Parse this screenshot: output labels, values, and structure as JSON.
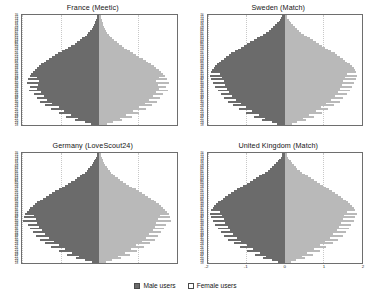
{
  "figure": {
    "background_color": "#ffffff",
    "male_color": "#6b6b6b",
    "female_color": "#b9b9b9"
  },
  "legend": {
    "position": "bottom-center",
    "items": [
      {
        "label": "Male users",
        "key": "male",
        "color": "#6b6b6b"
      },
      {
        "label": "Female users",
        "key": "female",
        "color": "#ffffff"
      }
    ]
  },
  "chart_data": [
    {
      "type": "bar",
      "subtype": "population-pyramid",
      "title": "France (Meetic)",
      "xlabel": "",
      "ylabel": "",
      "xlim": [
        -2,
        2
      ],
      "ylim": [
        18,
        76
      ],
      "grid": false,
      "xticks": [
        -2,
        -1,
        0,
        1,
        2
      ],
      "xtick_labels": [
        "-2",
        "-1",
        "0",
        "1",
        "2"
      ],
      "show_xticklabels": false,
      "categories": [
        76,
        75,
        74,
        73,
        72,
        71,
        70,
        69,
        68,
        67,
        66,
        65,
        64,
        63,
        62,
        61,
        60,
        59,
        58,
        57,
        56,
        55,
        54,
        53,
        52,
        51,
        50,
        49,
        48,
        47,
        46,
        45,
        44,
        43,
        42,
        41,
        40,
        39,
        38,
        37,
        36,
        35,
        34,
        33,
        32,
        31,
        30,
        29,
        28,
        27,
        26,
        25,
        24,
        23,
        22,
        21,
        20,
        19,
        18
      ],
      "series": [
        {
          "name": "Male users",
          "values": [
            -0.05,
            -0.07,
            -0.08,
            -0.1,
            -0.12,
            -0.14,
            -0.17,
            -0.2,
            -0.24,
            -0.28,
            -0.33,
            -0.38,
            -0.44,
            -0.5,
            -0.57,
            -0.64,
            -0.72,
            -0.8,
            -0.88,
            -0.97,
            -1.06,
            -1.14,
            -1.22,
            -1.3,
            -1.38,
            -1.44,
            -1.5,
            -1.56,
            -1.62,
            -1.67,
            -1.72,
            -1.76,
            -1.8,
            -1.62,
            -1.84,
            -1.55,
            -1.88,
            -1.58,
            -1.78,
            -1.6,
            -1.82,
            -1.52,
            -1.7,
            -1.44,
            -1.62,
            -1.34,
            -1.54,
            -1.22,
            -1.4,
            -1.05,
            -1.25,
            -0.9,
            -1.05,
            -0.72,
            -0.86,
            -0.55,
            -0.62,
            -0.38,
            -0.22
          ]
        },
        {
          "name": "Female users",
          "values": [
            0.04,
            0.05,
            0.06,
            0.08,
            0.09,
            0.11,
            0.13,
            0.15,
            0.18,
            0.21,
            0.25,
            0.29,
            0.34,
            0.39,
            0.45,
            0.51,
            0.58,
            0.65,
            0.72,
            0.8,
            0.88,
            0.96,
            1.04,
            1.12,
            1.2,
            1.27,
            1.34,
            1.41,
            1.48,
            1.54,
            1.6,
            1.66,
            1.71,
            1.54,
            1.76,
            1.48,
            1.8,
            1.52,
            1.72,
            1.55,
            1.78,
            1.48,
            1.66,
            1.4,
            1.58,
            1.3,
            1.5,
            1.18,
            1.36,
            1.02,
            1.22,
            0.88,
            1.02,
            0.7,
            0.84,
            0.54,
            0.6,
            0.36,
            0.2
          ]
        }
      ]
    },
    {
      "type": "bar",
      "subtype": "population-pyramid",
      "title": "Sweden (Match)",
      "xlabel": "",
      "ylabel": "",
      "xlim": [
        -2,
        2
      ],
      "ylim": [
        18,
        76
      ],
      "grid": false,
      "xticks": [
        -2,
        -1,
        0,
        1,
        2
      ],
      "xtick_labels": [
        "-2",
        "-1",
        "0",
        "1",
        "2"
      ],
      "show_xticklabels": false,
      "categories": [
        76,
        75,
        74,
        73,
        72,
        71,
        70,
        69,
        68,
        67,
        66,
        65,
        64,
        63,
        62,
        61,
        60,
        59,
        58,
        57,
        56,
        55,
        54,
        53,
        52,
        51,
        50,
        49,
        48,
        47,
        46,
        45,
        44,
        43,
        42,
        41,
        40,
        39,
        38,
        37,
        36,
        35,
        34,
        33,
        32,
        31,
        30,
        29,
        28,
        27,
        26,
        25,
        24,
        23,
        22,
        21,
        20,
        19,
        18
      ],
      "series": [
        {
          "name": "Male users",
          "values": [
            -0.06,
            -0.09,
            -0.12,
            -0.16,
            -0.2,
            -0.25,
            -0.3,
            -0.36,
            -0.42,
            -0.49,
            -0.56,
            -0.64,
            -0.72,
            -0.8,
            -0.89,
            -0.98,
            -1.06,
            -1.14,
            -1.22,
            -1.3,
            -1.38,
            -1.45,
            -1.52,
            -1.58,
            -1.64,
            -1.7,
            -1.75,
            -1.8,
            -1.84,
            -1.88,
            -1.91,
            -1.68,
            -1.94,
            -1.62,
            -1.9,
            -1.58,
            -1.86,
            -1.55,
            -1.8,
            -1.5,
            -1.74,
            -1.44,
            -1.66,
            -1.36,
            -1.58,
            -1.26,
            -1.48,
            -1.14,
            -1.34,
            -1.0,
            -1.18,
            -0.84,
            -1.0,
            -0.66,
            -0.8,
            -0.5,
            -0.58,
            -0.34,
            -0.2
          ]
        },
        {
          "name": "Female users",
          "values": [
            0.05,
            0.07,
            0.1,
            0.13,
            0.17,
            0.21,
            0.26,
            0.31,
            0.37,
            0.43,
            0.5,
            0.57,
            0.65,
            0.73,
            0.81,
            0.89,
            0.97,
            1.05,
            1.13,
            1.21,
            1.29,
            1.36,
            1.43,
            1.5,
            1.56,
            1.62,
            1.68,
            1.73,
            1.78,
            1.82,
            1.85,
            1.62,
            1.88,
            1.56,
            1.84,
            1.52,
            1.8,
            1.48,
            1.74,
            1.44,
            1.68,
            1.38,
            1.6,
            1.3,
            1.52,
            1.2,
            1.42,
            1.08,
            1.28,
            0.94,
            1.12,
            0.8,
            0.96,
            0.62,
            0.76,
            0.46,
            0.54,
            0.32,
            0.18
          ]
        }
      ]
    },
    {
      "type": "bar",
      "subtype": "population-pyramid",
      "title": "Germany (LoveScout24)",
      "xlabel": "",
      "ylabel": "",
      "xlim": [
        -2,
        2
      ],
      "ylim": [
        18,
        76
      ],
      "grid": false,
      "xticks": [
        -2,
        -1,
        0,
        1,
        2
      ],
      "xtick_labels": [
        "-2",
        "-1",
        "0",
        "1",
        "2"
      ],
      "show_xticklabels": false,
      "categories": [
        76,
        75,
        74,
        73,
        72,
        71,
        70,
        69,
        68,
        67,
        66,
        65,
        64,
        63,
        62,
        61,
        60,
        59,
        58,
        57,
        56,
        55,
        54,
        53,
        52,
        51,
        50,
        49,
        48,
        47,
        46,
        45,
        44,
        43,
        42,
        41,
        40,
        39,
        38,
        37,
        36,
        35,
        34,
        33,
        32,
        31,
        30,
        29,
        28,
        27,
        26,
        25,
        24,
        23,
        22,
        21,
        20,
        19,
        18
      ],
      "series": [
        {
          "name": "Male users",
          "values": [
            -0.05,
            -0.07,
            -0.09,
            -0.11,
            -0.14,
            -0.17,
            -0.2,
            -0.24,
            -0.28,
            -0.33,
            -0.38,
            -0.44,
            -0.5,
            -0.57,
            -0.64,
            -0.72,
            -0.8,
            -0.88,
            -0.96,
            -1.05,
            -1.14,
            -1.22,
            -1.3,
            -1.38,
            -1.46,
            -1.53,
            -1.6,
            -1.66,
            -1.72,
            -1.78,
            -1.83,
            -1.88,
            -1.92,
            -1.7,
            -1.96,
            -1.64,
            -1.98,
            -1.6,
            -1.84,
            -1.56,
            -1.8,
            -1.48,
            -1.72,
            -1.4,
            -1.64,
            -1.3,
            -1.54,
            -1.18,
            -1.4,
            -1.04,
            -1.24,
            -0.88,
            -1.04,
            -0.7,
            -0.84,
            -0.52,
            -0.6,
            -0.36,
            -0.2
          ]
        },
        {
          "name": "Female users",
          "values": [
            0.04,
            0.05,
            0.07,
            0.09,
            0.11,
            0.13,
            0.16,
            0.19,
            0.23,
            0.27,
            0.31,
            0.36,
            0.42,
            0.48,
            0.55,
            0.62,
            0.7,
            0.78,
            0.86,
            0.94,
            1.02,
            1.1,
            1.18,
            1.26,
            1.34,
            1.41,
            1.48,
            1.54,
            1.6,
            1.66,
            1.71,
            1.76,
            1.8,
            1.58,
            1.84,
            1.52,
            1.86,
            1.48,
            1.72,
            1.44,
            1.68,
            1.38,
            1.6,
            1.3,
            1.52,
            1.22,
            1.44,
            1.1,
            1.32,
            0.96,
            1.16,
            0.82,
            0.98,
            0.66,
            0.8,
            0.48,
            0.56,
            0.34,
            0.18
          ]
        }
      ]
    },
    {
      "type": "bar",
      "subtype": "population-pyramid",
      "title": "United Kingdom (Match)",
      "xlabel": "",
      "ylabel": "",
      "xlim": [
        -2,
        2
      ],
      "ylim": [
        18,
        76
      ],
      "grid": false,
      "xticks": [
        -2,
        -1,
        0,
        1,
        2
      ],
      "xtick_labels": [
        "-2",
        "-1",
        "0",
        "1",
        "2"
      ],
      "show_xticklabels": true,
      "categories": [
        76,
        75,
        74,
        73,
        72,
        71,
        70,
        69,
        68,
        67,
        66,
        65,
        64,
        63,
        62,
        61,
        60,
        59,
        58,
        57,
        56,
        55,
        54,
        53,
        52,
        51,
        50,
        49,
        48,
        47,
        46,
        45,
        44,
        43,
        42,
        41,
        40,
        39,
        38,
        37,
        36,
        35,
        34,
        33,
        32,
        31,
        30,
        29,
        28,
        27,
        26,
        25,
        24,
        23,
        22,
        21,
        20,
        19,
        18
      ],
      "series": [
        {
          "name": "Male users",
          "values": [
            -0.06,
            -0.08,
            -0.11,
            -0.14,
            -0.18,
            -0.22,
            -0.27,
            -0.32,
            -0.38,
            -0.44,
            -0.51,
            -0.58,
            -0.66,
            -0.74,
            -0.82,
            -0.9,
            -0.99,
            -1.08,
            -1.16,
            -1.24,
            -1.32,
            -1.4,
            -1.47,
            -1.54,
            -1.6,
            -1.66,
            -1.72,
            -1.77,
            -1.82,
            -1.86,
            -1.9,
            -1.68,
            -1.93,
            -1.62,
            -1.9,
            -1.58,
            -1.86,
            -1.54,
            -1.8,
            -1.48,
            -1.74,
            -1.42,
            -1.66,
            -1.34,
            -1.58,
            -1.24,
            -1.46,
            -1.12,
            -1.32,
            -0.98,
            -1.16,
            -0.82,
            -0.98,
            -0.64,
            -0.78,
            -0.48,
            -0.56,
            -0.32,
            -0.18
          ]
        },
        {
          "name": "Female users",
          "values": [
            0.05,
            0.07,
            0.09,
            0.12,
            0.15,
            0.19,
            0.23,
            0.28,
            0.33,
            0.39,
            0.45,
            0.52,
            0.59,
            0.67,
            0.75,
            0.83,
            0.91,
            0.99,
            1.07,
            1.15,
            1.23,
            1.31,
            1.38,
            1.45,
            1.52,
            1.58,
            1.64,
            1.7,
            1.75,
            1.79,
            1.83,
            1.6,
            1.86,
            1.54,
            1.82,
            1.5,
            1.78,
            1.46,
            1.72,
            1.4,
            1.66,
            1.34,
            1.58,
            1.26,
            1.5,
            1.16,
            1.38,
            1.04,
            1.24,
            0.9,
            1.08,
            0.76,
            0.92,
            0.58,
            0.72,
            0.44,
            0.52,
            0.3,
            0.16
          ]
        }
      ]
    }
  ]
}
